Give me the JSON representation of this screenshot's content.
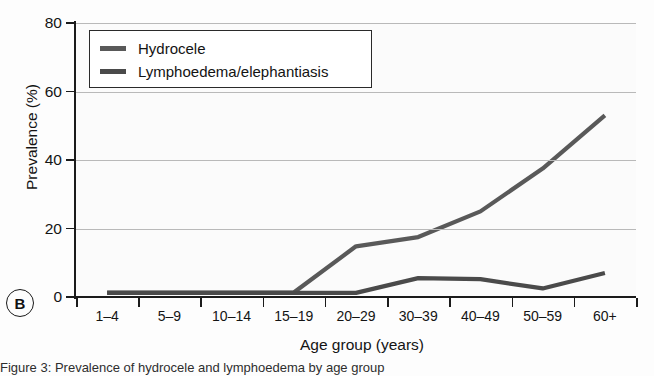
{
  "figure": {
    "panel_letter": "B",
    "caption": "Figure 3: Prevalence of hydrocele and lymphoedema by age group"
  },
  "chart_data": {
    "type": "line",
    "title": "",
    "xlabel": "Age group (years)",
    "ylabel": "Prevalence (%)",
    "categories": [
      "1–4",
      "5–9",
      "10–14",
      "15–19",
      "20–29",
      "30–39",
      "40–49",
      "50–59",
      "60+"
    ],
    "ylim": [
      0,
      80
    ],
    "yticks": [
      0,
      20,
      40,
      60,
      80
    ],
    "ytick_labels": [
      "0",
      "20",
      "40",
      "60",
      "80"
    ],
    "grid": true,
    "grid_axis": "y",
    "legend_position": "upper-left",
    "series": [
      {
        "name": "Hydrocele",
        "color": "#595959",
        "values": [
          1.3,
          1.3,
          1.3,
          1.3,
          14.8,
          17.5,
          25.0,
          37.5,
          53.0
        ]
      },
      {
        "name": "Lymphoedema/elephantiasis",
        "color": "#4a4a4a",
        "values": [
          1.2,
          1.2,
          1.2,
          1.2,
          1.2,
          5.5,
          5.2,
          2.5,
          7.0
        ]
      }
    ]
  }
}
